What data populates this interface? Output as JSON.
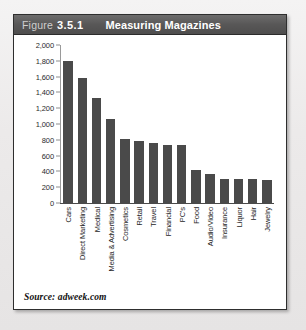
{
  "figure": {
    "label": "Figure",
    "number": "3.5.1",
    "title": "Measuring Magazines",
    "source": "Source: adweek.com"
  },
  "style": {
    "bar_color": "#4a4a4a",
    "header_bg": "#585757",
    "header_text": "#ffffff",
    "frame_border": "#2e2e2e",
    "page_bg": "#eceaea"
  },
  "chart_data": {
    "type": "bar",
    "title": "Measuring Magazines",
    "xlabel": "",
    "ylabel": "",
    "ylim": [
      0,
      2000
    ],
    "grid": false,
    "legend": "none",
    "ytick_labels": [
      "0",
      "200",
      "400",
      "600",
      "800",
      "1,000",
      "1,200",
      "1,400",
      "1,600",
      "1,800",
      "2,000"
    ],
    "yticks": [
      0,
      200,
      400,
      600,
      800,
      1000,
      1200,
      1400,
      1600,
      1800,
      2000
    ],
    "categories": [
      "Cars",
      "Direct Marketing",
      "Medical",
      "Media & Advertising",
      "Cosmetics",
      "Retail",
      "Travel",
      "Financial",
      "PC's",
      "Food",
      "Audio/Video",
      "Insurance",
      "Liquor",
      "Hair",
      "Jewelry"
    ],
    "values": [
      1800,
      1580,
      1330,
      1060,
      810,
      780,
      755,
      740,
      730,
      420,
      370,
      310,
      310,
      300,
      290
    ]
  }
}
